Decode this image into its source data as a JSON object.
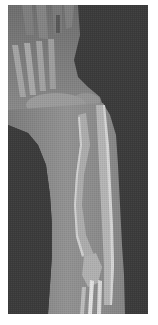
{
  "image": {
    "kind": "radiograph",
    "subject": "forearm and hand X-ray",
    "view": "lateral",
    "colors": {
      "border": "#ffffff",
      "background": "#3b3b3b",
      "soft_tissue": "#8a8a8a",
      "soft_tissue_light": "#9a9a9a",
      "bone": "#b8b8b8",
      "bone_cortex": "#d8d8d8"
    }
  }
}
